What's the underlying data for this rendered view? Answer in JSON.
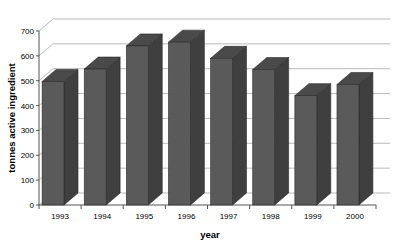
{
  "chart_data": {
    "type": "bar",
    "title": "",
    "subtitle": "",
    "xlabel": "year",
    "ylabel": "tonnes active ingredient",
    "categories": [
      "1993",
      "1994",
      "1995",
      "1996",
      "1997",
      "1998",
      "1999",
      "2000"
    ],
    "values": [
      497,
      547,
      640,
      655,
      590,
      545,
      440,
      485
    ],
    "series": [
      {
        "name": "tonnes active ingredient",
        "values": [
          497,
          547,
          640,
          655,
          590,
          545,
          440,
          485
        ]
      }
    ],
    "ylim": [
      0,
      700
    ],
    "yticks": [
      0,
      100,
      200,
      300,
      400,
      500,
      600,
      700
    ],
    "ytick_labels": [
      "0",
      "100",
      "200",
      "300",
      "400",
      "500",
      "600",
      "700"
    ],
    "grid": true,
    "grid_axis": "y",
    "legend": false,
    "legend_position": "none",
    "style": "3d-column",
    "bar_color": "#5a5a5a",
    "bar_side_color": "#3f3f3f",
    "bar_top_color": "#4a4a4a",
    "grid_color": "#a8a8a8",
    "axis_color": "#555555",
    "background_color": "#ffffff"
  }
}
